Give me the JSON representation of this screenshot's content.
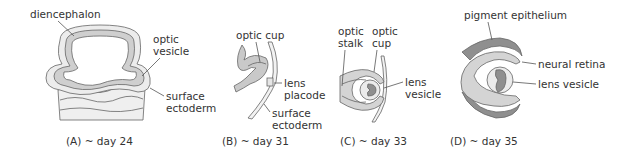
{
  "panels": [
    {
      "id": "A",
      "caption": "(A)  ~ day 24",
      "labels": {
        "diencephalon": "diencephalon",
        "optic_vesicle_1": "optic",
        "optic_vesicle_2": "vesicle",
        "surface_ectoderm_1": "surface",
        "surface_ectoderm_2": "ectoderm"
      }
    },
    {
      "id": "B",
      "caption": "(B)  ~ day 31",
      "labels": {
        "optic_cup": "optic cup",
        "lens_placode_1": "lens",
        "lens_placode_2": "placode",
        "surface_ectoderm_1": "surface",
        "surface_ectoderm_2": "ectoderm"
      }
    },
    {
      "id": "C",
      "caption": "(C)  ~ day 33",
      "labels": {
        "optic_stalk_1": "optic",
        "optic_stalk_2": "stalk",
        "optic_cup_1": "optic",
        "optic_cup_2": "cup",
        "lens_vesicle_1": "lens",
        "lens_vesicle_2": "vesicle"
      }
    },
    {
      "id": "D",
      "caption": "(D)  ~ day 35",
      "labels": {
        "pigment_epithelium": "pigment epithelium",
        "neural_retina": "neural retina",
        "lens_vesicle": "lens vesicle"
      }
    }
  ],
  "colors": {
    "light_fill": "#ebebeb",
    "mid_fill": "#c9c9c9",
    "dark_fill": "#8f8f8f",
    "outline": "#666666",
    "text": "#333333"
  }
}
